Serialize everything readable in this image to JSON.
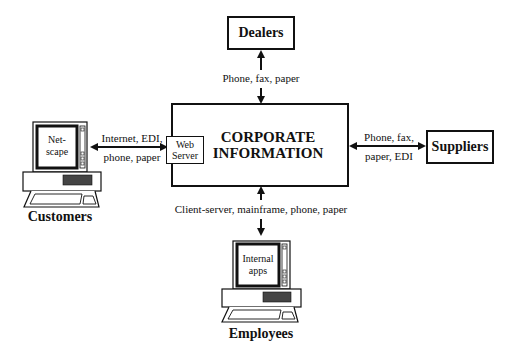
{
  "nodes": {
    "dealers": {
      "label": "Dealers"
    },
    "suppliers": {
      "label": "Suppliers"
    },
    "corporate": {
      "line1": "CORPORATE",
      "line2": "INFORMATION"
    },
    "web_server": {
      "line1": "Web",
      "line2": "Server"
    },
    "customers": {
      "label": "Customers",
      "screen_line1": "Net-",
      "screen_line2": "scape"
    },
    "employees": {
      "label": "Employees",
      "screen_line1": "Internal",
      "screen_line2": "apps"
    }
  },
  "edges": {
    "dealers": {
      "label": "Phone, fax, paper"
    },
    "suppliers": {
      "line1": "Phone, fax,",
      "line2": "paper, EDI"
    },
    "customers": {
      "line1": "Internet, EDI,",
      "line2": "phone, paper"
    },
    "employees": {
      "label": "Client-server, mainframe, phone, paper"
    }
  }
}
